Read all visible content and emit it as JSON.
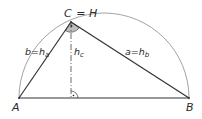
{
  "diagram": {
    "type": "geometry",
    "colors": {
      "stroke": "#333333",
      "arc": "#888888",
      "angle_fill": "#b8b8b8",
      "text": "#2a2a2a"
    },
    "points": {
      "A": {
        "label": "A",
        "x": 19,
        "y": 98
      },
      "B": {
        "label": "B",
        "x": 189,
        "y": 98
      },
      "C": {
        "label": "C",
        "x": 71,
        "y": 22
      },
      "foot": {
        "x": 71,
        "y": 98
      }
    },
    "labels": {
      "vertex_c": "C",
      "equals": "=",
      "orthocenter": "H",
      "vertex_a": "A",
      "vertex_b": "B",
      "side_b": {
        "main": "b",
        "equals": "=",
        "h": "h",
        "sub": "a"
      },
      "side_a": {
        "main": "a",
        "equals": "=",
        "h": "h",
        "sub": "b"
      },
      "altitude": {
        "h": "h",
        "sub": "c"
      }
    },
    "semicircle": {
      "cx": 104,
      "cy": 98,
      "r": 85
    },
    "right_angle_markers": [
      "at C (shaded arc with dot)",
      "at foot of h_c (arc with dot)"
    ]
  }
}
